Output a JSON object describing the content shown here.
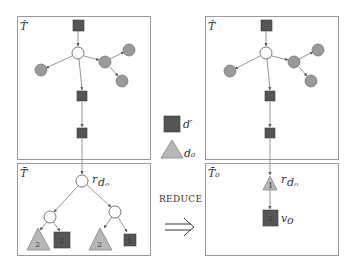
{
  "colors": {
    "square": "#555555",
    "gray_circle": "#9a9a9a",
    "triangle": "#b8b8b8",
    "border": "#9a9a9a",
    "edge": "#7a7a7a"
  },
  "legend": {
    "square_label": "d′",
    "triangle_label": "d₀"
  },
  "transform": {
    "label": "REDUCE",
    "arrow": "⟹"
  },
  "left": {
    "top_panel": {
      "label": "T̂",
      "nodes": [
        {
          "id": "sq_top",
          "type": "square"
        },
        {
          "id": "root",
          "type": "white-circle"
        },
        {
          "id": "g_left",
          "type": "gray-circle"
        },
        {
          "id": "g_mid",
          "type": "gray-circle"
        },
        {
          "id": "g_tr",
          "type": "gray-circle"
        },
        {
          "id": "g_br",
          "type": "gray-circle"
        },
        {
          "id": "sq_mid",
          "type": "square"
        },
        {
          "id": "sq_low",
          "type": "square"
        }
      ]
    },
    "bottom_panel": {
      "label": "T̄",
      "root_label": "r",
      "root_sub": "dₒ",
      "leaves": [
        {
          "type": "triangle",
          "value": "2"
        },
        {
          "type": "square",
          "value": "2"
        },
        {
          "type": "triangle",
          "value": "2"
        },
        {
          "type": "square",
          "value": "1"
        }
      ]
    }
  },
  "right": {
    "top_panel": {
      "label": "T̂"
    },
    "bottom_panel": {
      "label": "T̄₀",
      "triangle_value": "1",
      "triangle_label": "r",
      "triangle_sub": "dₒ",
      "square_value": "2",
      "square_label": "v",
      "square_sub": "o"
    }
  }
}
